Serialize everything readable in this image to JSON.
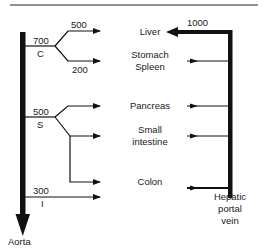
{
  "diagram": {
    "title": "",
    "colors": {
      "line": "#111111",
      "background": "#ffffff"
    },
    "vessels": {
      "aorta": {
        "label": "Aorta"
      },
      "portal_vein": {
        "label_lines": [
          "Hepatic",
          "portal",
          "vein"
        ],
        "flow_to_liver": "1000"
      }
    },
    "arteries": [
      {
        "id": "C",
        "label": "C",
        "flow": "700",
        "branches": [
          {
            "target": "Liver",
            "flow": "500"
          },
          {
            "target": "Stomach Spleen",
            "flow": "200"
          }
        ]
      },
      {
        "id": "S",
        "label": "S",
        "flow": "500",
        "branches": [
          {
            "target": "Pancreas"
          },
          {
            "target": "Small intestine"
          },
          {
            "target": "Colon"
          }
        ]
      },
      {
        "id": "I",
        "label": "I",
        "flow": "300",
        "branches": [
          {
            "target": "Colon"
          }
        ]
      }
    ],
    "organs": {
      "liver": "Liver",
      "stomach": [
        "Stomach",
        "Spleen"
      ],
      "pancreas": "Pancreas",
      "small_intestine": [
        "Small",
        "intestine"
      ],
      "colon": "Colon"
    }
  }
}
